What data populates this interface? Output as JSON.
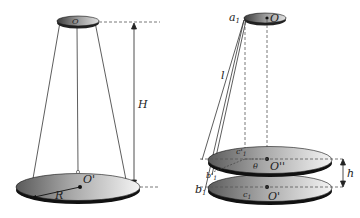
{
  "left_figure": {
    "top_disk_labels": {
      "small": "r",
      "center": "O"
    },
    "bottom_disk_labels": {
      "center": "O'",
      "radius": "R"
    },
    "height_label": "H"
  },
  "right_figure": {
    "top_labels": {
      "corner": "a",
      "corner_sub": "1",
      "center": "O"
    },
    "string_label": "l",
    "upper_disk_labels": {
      "point": "c'",
      "point_sub": "1",
      "angle": "θ",
      "center": "O''"
    },
    "lower_disk_labels": {
      "corner": "b",
      "corner_sub": "1",
      "point": "c",
      "point_sub": "1",
      "center": "O'",
      "b_prime": "b'",
      "b_prime_sub": "1"
    },
    "gap_label": "h"
  },
  "colors": {
    "disk_light": "#f2f2f2",
    "disk_dark": "#6e6e6e",
    "edge": "#111111",
    "line": "#333333",
    "dashed": "#555555"
  }
}
